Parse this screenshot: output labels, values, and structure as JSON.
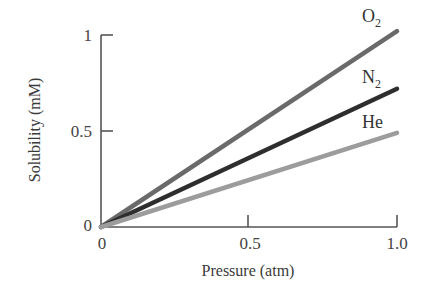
{
  "chart_data": {
    "type": "line",
    "title": "",
    "xlabel": "Pressure (atm)",
    "ylabel": "Solubility (mM)",
    "xlim": [
      0,
      1.0
    ],
    "ylim": [
      0,
      1.0
    ],
    "x_ticks": [
      0,
      0.5,
      1.0
    ],
    "x_tick_labels": [
      "0",
      "0.5",
      "1.0"
    ],
    "y_ticks": [
      0,
      0.5,
      1
    ],
    "y_tick_labels": [
      "0",
      "0.5",
      "1"
    ],
    "grid": false,
    "legend_position": "inline-right",
    "x": [
      0,
      1.0
    ],
    "series": [
      {
        "name": "O2",
        "label_main": "O",
        "label_sub": "2",
        "values": [
          0,
          1.02
        ],
        "color": "#6a6a6a"
      },
      {
        "name": "N2",
        "label_main": "N",
        "label_sub": "2",
        "values": [
          0,
          0.72
        ],
        "color": "#2e2e2e"
      },
      {
        "name": "He",
        "label_main": "He",
        "label_sub": "",
        "values": [
          0,
          0.49
        ],
        "color": "#9c9c9c"
      }
    ]
  }
}
